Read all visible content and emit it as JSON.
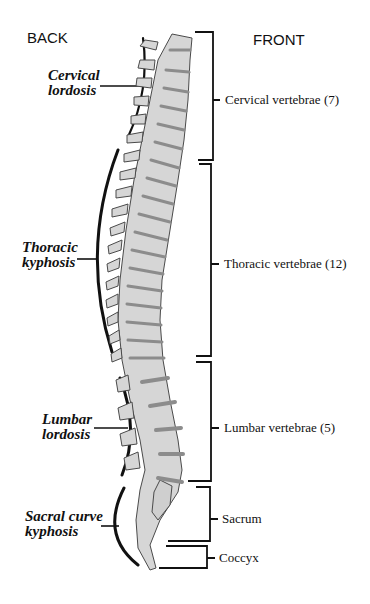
{
  "diagram": {
    "orientation": {
      "back_label": "BACK",
      "front_label": "FRONT"
    },
    "curves": [
      {
        "line1": "Cervical",
        "line2": "lordosis"
      },
      {
        "line1": "Thoracic",
        "line2": "kyphosis"
      },
      {
        "line1": "Lumbar",
        "line2": "lordosis"
      },
      {
        "line1": "Sacral curve",
        "line2": "kyphosis"
      }
    ],
    "regions": [
      {
        "label": "Cervical vertebrae (7)"
      },
      {
        "label": "Thoracic vertebrae (12)"
      },
      {
        "label": "Lumbar vertebrae (5)"
      },
      {
        "label": "Sacrum"
      },
      {
        "label": "Coccyx"
      }
    ],
    "colors": {
      "bone_fill": "#d6d6d6",
      "bone_outline": "#4a4a4a",
      "disc": "#8c8c8c",
      "lines": "#111111"
    }
  }
}
